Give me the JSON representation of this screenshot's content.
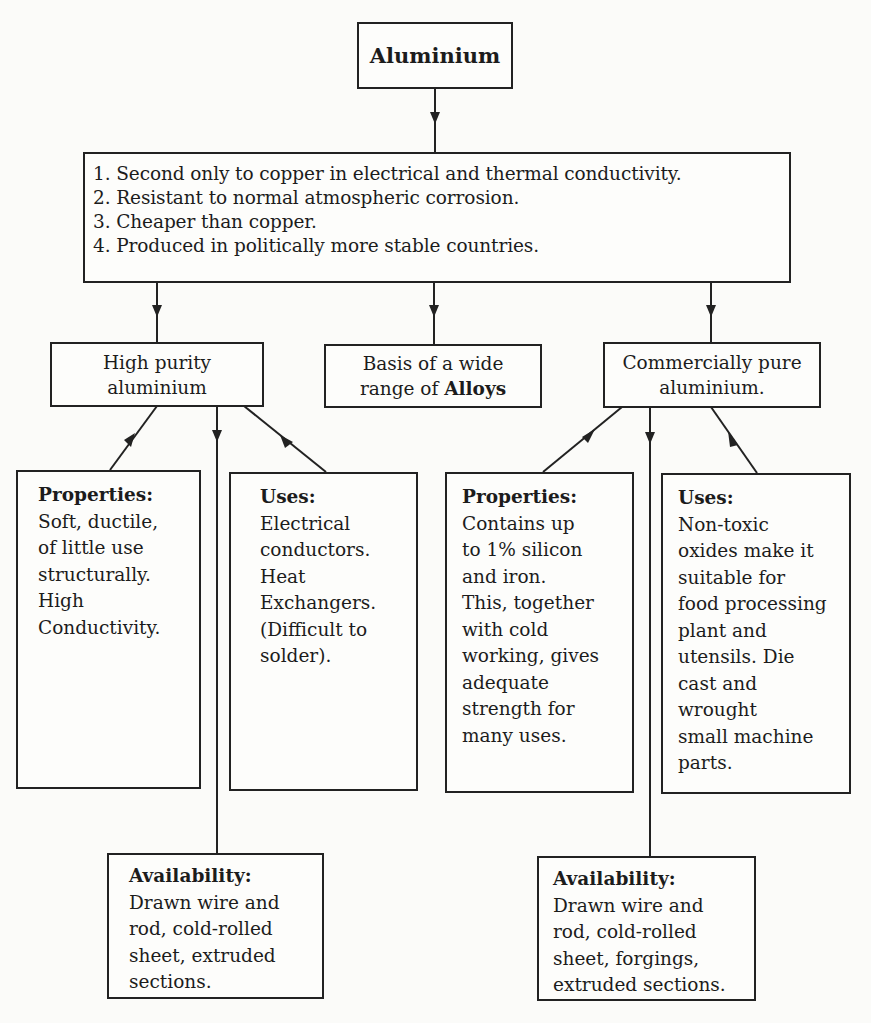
{
  "diagram": {
    "root": {
      "label": "Aluminium"
    },
    "characteristics": [
      "1. Second only to copper in electrical and thermal conductivity.",
      "2. Resistant to normal atmospheric corrosion.",
      "3. Cheaper than copper.",
      "4. Produced in politically more stable countries."
    ],
    "branches": {
      "high_purity": {
        "lines": [
          "High purity",
          "aluminium"
        ]
      },
      "alloys": {
        "line1": "Basis of a wide",
        "line2_prefix": "range of ",
        "line2_bold": "Alloys"
      },
      "commercial": {
        "lines": [
          "Commercially pure",
          "aluminium."
        ]
      }
    },
    "high_purity_details": {
      "properties": {
        "heading": "Properties:",
        "lines": [
          "Soft, ductile,",
          "of little use",
          "structurally.",
          "High",
          "Conductivity."
        ]
      },
      "uses": {
        "heading": "Uses:",
        "lines": [
          "Electrical",
          "conductors.",
          "Heat",
          "Exchangers.",
          "(Difficult to",
          "solder)."
        ]
      },
      "availability": {
        "heading": "Availability:",
        "lines": [
          "Drawn wire and",
          "rod, cold-rolled",
          "sheet, extruded",
          "sections."
        ]
      }
    },
    "commercial_details": {
      "properties": {
        "heading": "Properties:",
        "lines": [
          "Contains up",
          "to 1% silicon",
          "and iron.",
          "This, together",
          "with cold",
          "working, gives",
          "adequate",
          "strength for",
          "many uses."
        ]
      },
      "uses": {
        "heading": "Uses:",
        "lines": [
          "Non-toxic",
          "oxides make it",
          "suitable for",
          "food processing",
          "plant and",
          "utensils. Die",
          "cast and",
          "wrought",
          "small machine",
          "parts."
        ]
      },
      "availability": {
        "heading": "Availability:",
        "lines": [
          "Drawn wire and",
          "rod, cold-rolled",
          "sheet, forgings,",
          "extruded sections."
        ]
      }
    }
  },
  "colors": {
    "line": "#222222",
    "background": "#fbfbf9",
    "text": "#1c1c1c"
  }
}
